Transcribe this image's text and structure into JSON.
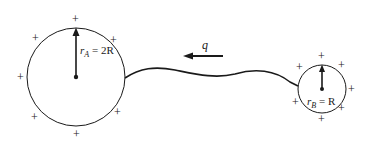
{
  "diagram": {
    "sphere_a": {
      "label_r": "r",
      "label_sub": "A",
      "label_eq": " = 2R",
      "charges": [
        "+",
        "+",
        "+",
        "+",
        "+",
        "+",
        "+"
      ]
    },
    "sphere_b": {
      "label_r": "r",
      "label_sub": "B",
      "label_eq": " = R",
      "charges": [
        "+",
        "+",
        "+",
        "+",
        "+",
        "+",
        "+",
        "+"
      ]
    },
    "charge_flow": {
      "label": "q",
      "direction": "left"
    },
    "colors": {
      "stroke": "#1a1a1a",
      "background": "#ffffff"
    }
  }
}
